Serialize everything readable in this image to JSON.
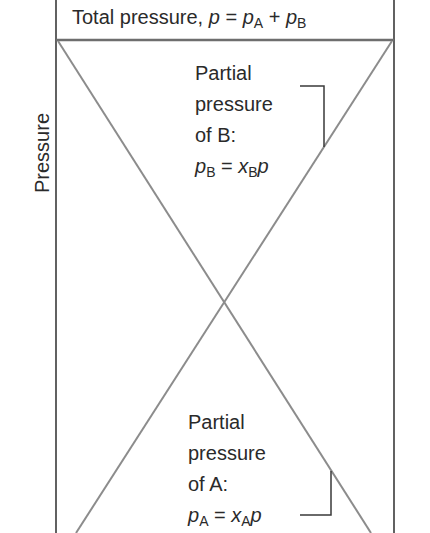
{
  "diagram": {
    "title": {
      "text": "Total pressure, ",
      "var_p": "p",
      "eq": " = ",
      "var_pA": "p",
      "sub_A": "A",
      "plus": " + ",
      "var_pB": "p",
      "sub_B": "B"
    },
    "y_axis_label": "Pressure",
    "label_B": {
      "line1": "Partial",
      "line2": "pressure",
      "line3": "of B:",
      "eq_p": "p",
      "eq_sub": "B",
      "eq_mid": " = ",
      "eq_x": "x",
      "eq_xsub": "B",
      "eq_end": "p"
    },
    "label_A": {
      "line1": "Partial",
      "line2": "pressure",
      "line3": "of A:",
      "eq_p": "p",
      "eq_sub": "A",
      "eq_mid": " = ",
      "eq_x": "x",
      "eq_xsub": "A",
      "eq_end": "p"
    },
    "colors": {
      "frame": "#3a3a3a",
      "lines": "#8c8c8c"
    }
  }
}
